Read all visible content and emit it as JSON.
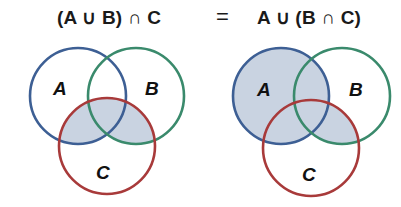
{
  "title": {
    "left_expression": "(A ∪ B) ∩ C",
    "equals": "=",
    "right_expression": "A ∪ (B ∩ C)"
  },
  "diagrams": [
    {
      "name": "left",
      "expression": "(A ∪ B) ∩ C",
      "labels": {
        "A": "A",
        "B": "B",
        "C": "C"
      },
      "shaded_regions": [
        "A∩C",
        "B∩C",
        "A∩B∩C"
      ]
    },
    {
      "name": "right",
      "expression": "A ∪ (B ∩ C)",
      "labels": {
        "A": "A",
        "B": "B",
        "C": "C"
      },
      "shaded_regions": [
        "A",
        "B∩C"
      ]
    }
  ],
  "colors": {
    "circle_A": "#3d5f94",
    "circle_B": "#3a8a6c",
    "circle_C": "#a83a3a",
    "shade": "#c9d3e1"
  }
}
